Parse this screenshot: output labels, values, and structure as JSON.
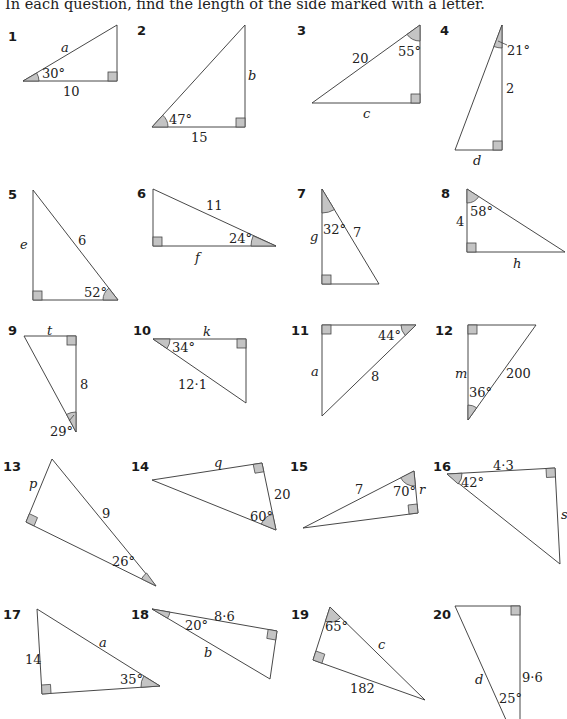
{
  "instruction": "In each question, find the length of the side marked with a letter.",
  "colors": {
    "line": "#333333",
    "shade": "#c4c4c4",
    "text": "#222222"
  },
  "questions": [
    {
      "num": "1",
      "unknown": "a",
      "side": "10",
      "angle": "30°"
    },
    {
      "num": "2",
      "unknown": "b",
      "side": "15",
      "angle": "47°"
    },
    {
      "num": "3",
      "unknown": "c",
      "side": "20",
      "angle": "55°"
    },
    {
      "num": "4",
      "unknown": "d",
      "side": "2",
      "angle": "21°"
    },
    {
      "num": "5",
      "unknown": "e",
      "side": "6",
      "angle": "52°"
    },
    {
      "num": "6",
      "unknown": "f",
      "side": "11",
      "angle": "24°"
    },
    {
      "num": "7",
      "unknown": "g",
      "side": "7",
      "angle": "32°"
    },
    {
      "num": "8",
      "unknown": "h",
      "side": "4",
      "angle": "58°"
    },
    {
      "num": "9",
      "unknown": "t",
      "side": "8",
      "angle": "29°"
    },
    {
      "num": "10",
      "unknown": "k",
      "side": "12·1",
      "angle": "34°"
    },
    {
      "num": "11",
      "unknown": "a",
      "side": "8",
      "angle": "44°"
    },
    {
      "num": "12",
      "unknown": "m",
      "side": "200",
      "angle": "36°"
    },
    {
      "num": "13",
      "unknown": "p",
      "side": "9",
      "angle": "26°"
    },
    {
      "num": "14",
      "unknown": "q",
      "side": "20",
      "angle": "60°"
    },
    {
      "num": "15",
      "unknown": "r",
      "side": "7",
      "angle": "70°"
    },
    {
      "num": "16",
      "unknown": "s",
      "side": "4·3",
      "angle": "42°"
    },
    {
      "num": "17",
      "unknown": "a",
      "side": "14",
      "angle": "35°"
    },
    {
      "num": "18",
      "unknown": "b",
      "side": "8·6",
      "angle": "20°"
    },
    {
      "num": "19",
      "unknown": "c",
      "side": "182",
      "angle": "65°"
    },
    {
      "num": "20",
      "unknown": "d",
      "side": "9·6",
      "angle": "25°"
    }
  ]
}
